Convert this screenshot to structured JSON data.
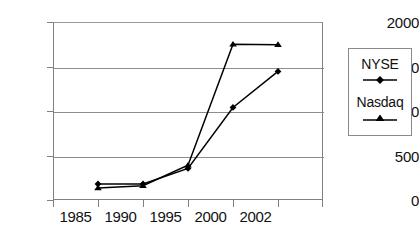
{
  "chart_data": {
    "type": "line",
    "title": "",
    "xlabel": "",
    "ylabel": "",
    "categories": [
      "1985",
      "1990",
      "1995",
      "2000",
      "2002"
    ],
    "ylim": [
      0,
      2000
    ],
    "yticks": [
      "0",
      "500",
      "1000",
      "1500",
      "2000"
    ],
    "grid": "horizontal",
    "legend_position": "right-outside",
    "series": [
      {
        "name": "NYSE",
        "marker": "diamond",
        "values": [
          180,
          180,
          355,
          1040,
          1445
        ]
      },
      {
        "name": "Nasdaq",
        "marker": "triangle",
        "values": [
          135,
          160,
          390,
          1750,
          1745
        ]
      }
    ]
  },
  "axes": {
    "y_tick_labels": [
      "2000",
      "1500",
      "1000",
      "500",
      "0"
    ],
    "x_tick_labels": [
      "1985",
      "1990",
      "1995",
      "2000",
      "2002"
    ]
  },
  "legend": {
    "entries": [
      {
        "label": "NYSE",
        "marker": "diamond-marker-icon"
      },
      {
        "label": "Nasdaq",
        "marker": "triangle-marker-icon"
      }
    ]
  },
  "colors": {
    "series_line": "#000000",
    "gridline": "#8c8c8c",
    "axis": "#808080",
    "text": "#111111",
    "background": "#ffffff"
  }
}
